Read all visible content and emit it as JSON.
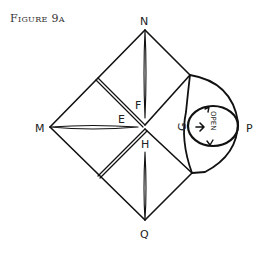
{
  "figure": {
    "title": "Figure 9a"
  },
  "diagram": {
    "labels": {
      "N": "N",
      "M": "M",
      "P": "P",
      "Q": "Q",
      "E": "E",
      "F": "F",
      "G": "G",
      "H": "H",
      "open": "OPEN"
    },
    "stroke_color": "#111111"
  }
}
